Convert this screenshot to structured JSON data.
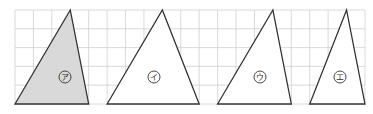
{
  "grid": {
    "origin_x": 15,
    "origin_y": 10,
    "cell_w": 18.42,
    "cell_h": 18.8,
    "cols": 19,
    "rows": 5,
    "line_color": "#d0d0d0"
  },
  "triangles": [
    {
      "id": "a",
      "label": "ア",
      "base": [
        0,
        4
      ],
      "apex": 3,
      "fill": "#d9d9d9",
      "label_pos": [
        65,
        77
      ]
    },
    {
      "id": "i",
      "label": "イ",
      "base": [
        5,
        10
      ],
      "apex": 8,
      "fill": "#ffffff",
      "label_pos": [
        154,
        77
      ]
    },
    {
      "id": "u",
      "label": "ウ",
      "base": [
        11,
        15
      ],
      "apex": 14,
      "fill": "#ffffff",
      "label_pos": [
        260,
        77
      ]
    },
    {
      "id": "e",
      "label": "エ",
      "base": [
        16,
        19
      ],
      "apex": 18,
      "fill": "#ffffff",
      "label_pos": [
        340,
        77
      ]
    }
  ],
  "stroke_color": "#333333"
}
